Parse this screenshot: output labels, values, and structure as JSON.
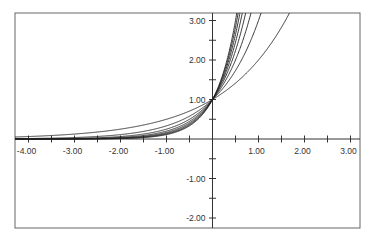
{
  "chart_data": {
    "type": "line",
    "title": "",
    "xlabel": "",
    "ylabel": "",
    "xlim": [
      -4.3,
      3.23
    ],
    "ylim": [
      -2.26,
      3.19
    ],
    "grid": false,
    "legend": null,
    "x_ticks": {
      "major": [
        -4,
        -3,
        -2,
        -1,
        1,
        2,
        3
      ],
      "minor_step": 0.5,
      "labels": [
        "-4.00",
        "-3.00",
        "-2.00",
        "-1.00",
        "1.00",
        "2.00",
        "3.00"
      ]
    },
    "y_ticks": {
      "major": [
        -2,
        -1,
        1,
        2,
        3
      ],
      "minor_step": 0.5,
      "labels": [
        "-2.00",
        "-1.00",
        "1.00",
        "2.00",
        "3.00"
      ]
    },
    "series": [
      {
        "name": "y = 2^x",
        "base": 2
      },
      {
        "name": "y = 3^x",
        "base": 3
      },
      {
        "name": "y = 4^x",
        "base": 4
      },
      {
        "name": "y = 5^x",
        "base": 5
      },
      {
        "name": "y = 6^x",
        "base": 6
      },
      {
        "name": "y = 7^x",
        "base": 7
      },
      {
        "name": "y = 8^x",
        "base": 8
      },
      {
        "name": "y = 9^x",
        "base": 9
      }
    ],
    "annotations": [],
    "colors": {
      "line": "#222222",
      "axis": "#333333",
      "frame": "#666666"
    }
  }
}
